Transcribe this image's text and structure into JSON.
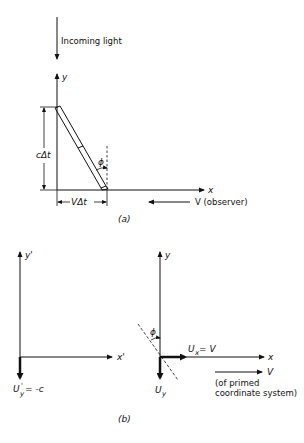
{
  "figure": {
    "part_a": {
      "caption": "(a)",
      "incoming_light_label": "Incoming light",
      "axis_y_label": "y",
      "axis_x_label": "x",
      "vertical_dim_label": "cΔt",
      "horizontal_dim_label": "VΔt",
      "angle_label": "ϕ",
      "observer_velocity_label": "V (observer)"
    },
    "part_b": {
      "caption": "(b)",
      "primed": {
        "axis_y_label": "y'",
        "axis_x_label": "x'",
        "velocity_label_main": "U",
        "velocity_label_prime": "'",
        "velocity_label_sub": "y",
        "velocity_label_value": " = -c"
      },
      "unprimed": {
        "axis_y_label": "y",
        "axis_x_label": "x",
        "angle_label": "ϕ",
        "ux_label_main": "U",
        "ux_label_sub": "x",
        "ux_label_value": " = V",
        "uy_label_main": "U",
        "uy_label_sub": "y",
        "frame_velocity_label": "V",
        "frame_velocity_note_line1": "(of primed",
        "frame_velocity_note_line2": "coordinate system)"
      }
    }
  }
}
